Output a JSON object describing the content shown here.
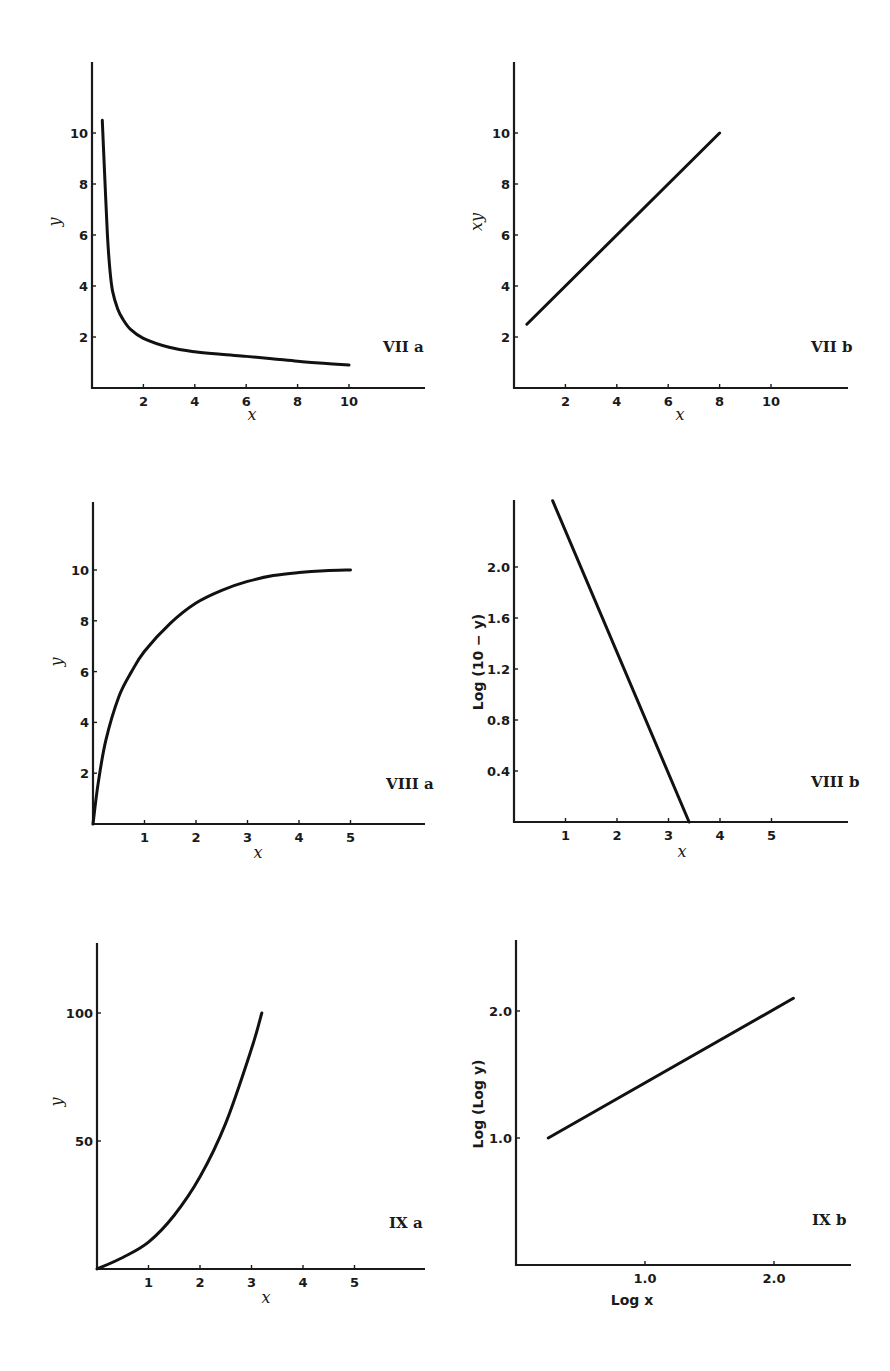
{
  "figure": {
    "panels": [
      {
        "id": "VIIa",
        "panel_label": "VII a",
        "xlabel": "x",
        "ylabel": "y",
        "origin_px": [
          92,
          388
        ],
        "x_end_px": 425,
        "y_top_px": 62,
        "x_scale": 25.7,
        "y_scale": 25.5,
        "x_offset": 0,
        "y_offset": 0,
        "xticks": [
          2,
          4,
          6,
          8,
          10
        ],
        "xtick_labels": [
          "2",
          "4",
          "6",
          "8",
          "10"
        ],
        "yticks": [
          2,
          4,
          6,
          8,
          10
        ],
        "ytick_labels": [
          "2",
          "4",
          "6",
          "8",
          "10"
        ],
        "label_pos": [
          383,
          352
        ]
      },
      {
        "id": "VIIb",
        "panel_label": "VII b",
        "xlabel": "x",
        "ylabel": "xy",
        "origin_px": [
          514,
          388
        ],
        "x_end_px": 848,
        "y_top_px": 62,
        "x_scale": 25.7,
        "y_scale": 25.5,
        "x_offset": 0,
        "y_offset": 0,
        "xticks": [
          2,
          4,
          6,
          8,
          10
        ],
        "xtick_labels": [
          "2",
          "4",
          "6",
          "8",
          "10"
        ],
        "yticks": [
          2,
          4,
          6,
          8,
          10
        ],
        "ytick_labels": [
          "2",
          "4",
          "6",
          "8",
          "10"
        ],
        "label_pos": [
          811,
          352
        ]
      },
      {
        "id": "VIIIa",
        "panel_label": "VIII a",
        "xlabel": "x",
        "ylabel": "y",
        "origin_px": [
          93,
          824
        ],
        "x_end_px": 425,
        "y_top_px": 502,
        "x_scale": 51.5,
        "y_scale": 25.4,
        "x_offset": 0,
        "y_offset": 0,
        "xticks": [
          1,
          2,
          3,
          4,
          5
        ],
        "xtick_labels": [
          "1",
          "2",
          "3",
          "4",
          "5"
        ],
        "yticks": [
          2,
          4,
          6,
          8,
          10
        ],
        "ytick_labels": [
          "2",
          "4",
          "6",
          "8",
          "10"
        ],
        "label_pos": [
          386,
          789
        ]
      },
      {
        "id": "VIIIb",
        "panel_label": "VIII b",
        "xlabel": "x",
        "ylabel": "Log (10 − y)",
        "origin_px": [
          514,
          822
        ],
        "x_end_px": 848,
        "y_top_px": 500,
        "x_scale": 51.5,
        "y_scale": 127.5,
        "x_offset": 0,
        "y_offset": 0,
        "xticks": [
          1,
          2,
          3,
          4,
          5
        ],
        "xtick_labels": [
          "1",
          "2",
          "3",
          "4",
          "5"
        ],
        "yticks": [
          0.4,
          0.8,
          1.2,
          1.6,
          2.0
        ],
        "ytick_labels": [
          "0.4",
          "0.8",
          "1.2",
          "1.6",
          "2.0"
        ],
        "label_pos": [
          811,
          787
        ]
      },
      {
        "id": "IXa",
        "panel_label": "IX a",
        "xlabel": "x",
        "ylabel": "y",
        "origin_px": [
          97,
          1269
        ],
        "x_end_px": 425,
        "y_top_px": 943,
        "x_scale": 51.5,
        "y_scale": 2.56,
        "x_offset": 0,
        "y_offset": 0,
        "xticks": [
          1,
          2,
          3,
          4,
          5
        ],
        "xtick_labels": [
          "1",
          "2",
          "3",
          "4",
          "5"
        ],
        "yticks": [
          50,
          100
        ],
        "ytick_labels": [
          "50",
          "100"
        ],
        "label_pos": [
          389,
          1228
        ]
      },
      {
        "id": "IXb",
        "panel_label": "IX b",
        "xlabel": "Log x",
        "ylabel": "Log (Log y)",
        "origin_px": [
          516,
          1265
        ],
        "x_end_px": 851,
        "y_top_px": 940,
        "x_scale": 129,
        "y_scale": 127,
        "x_offset": 0,
        "y_offset": 0,
        "xticks": [
          1.0,
          2.0
        ],
        "xtick_labels": [
          "1.0",
          "2.0"
        ],
        "yticks": [
          1.0,
          2.0
        ],
        "ytick_labels": [
          "1.0",
          "2.0"
        ],
        "label_pos": [
          812,
          1225
        ]
      }
    ]
  },
  "chart_data": [
    {
      "type": "line",
      "title": "VII a",
      "xlabel": "x",
      "ylabel": "y",
      "xlim": [
        0,
        12.5
      ],
      "ylim": [
        0,
        12.5
      ],
      "grid": false,
      "xticks": [
        2,
        4,
        6,
        8,
        10
      ],
      "yticks": [
        2,
        4,
        6,
        8,
        10
      ],
      "series": [
        {
          "name": "curve",
          "x": [
            0.4,
            0.5,
            0.6,
            0.7,
            0.8,
            1.0,
            1.2,
            1.5,
            2.0,
            3.0,
            4.0,
            5.0,
            6.0,
            7.0,
            8.0,
            9.0,
            10.0
          ],
          "y": [
            10.5,
            8.2,
            6.0,
            4.6,
            3.8,
            3.1,
            2.7,
            2.3,
            1.95,
            1.6,
            1.42,
            1.32,
            1.24,
            1.15,
            1.05,
            0.97,
            0.9
          ]
        }
      ]
    },
    {
      "type": "line",
      "title": "VII b",
      "xlabel": "x",
      "ylabel": "xy",
      "xlim": [
        0,
        13
      ],
      "ylim": [
        0,
        12.5
      ],
      "grid": false,
      "xticks": [
        2,
        4,
        6,
        8,
        10
      ],
      "yticks": [
        2,
        4,
        6,
        8,
        10
      ],
      "series": [
        {
          "name": "line",
          "x": [
            0.5,
            8.0
          ],
          "y": [
            2.5,
            10.0
          ]
        }
      ]
    },
    {
      "type": "line",
      "title": "VIII a",
      "xlabel": "x",
      "ylabel": "y",
      "xlim": [
        0,
        6.4
      ],
      "ylim": [
        0,
        12.5
      ],
      "grid": false,
      "xticks": [
        1,
        2,
        3,
        4,
        5
      ],
      "yticks": [
        2,
        4,
        6,
        8,
        10
      ],
      "series": [
        {
          "name": "curve",
          "x": [
            0,
            0.1,
            0.25,
            0.5,
            0.75,
            1.0,
            1.5,
            2.0,
            2.5,
            3.0,
            3.5,
            4.0,
            4.5,
            5.0
          ],
          "y": [
            0,
            1.6,
            3.3,
            5.0,
            6.0,
            6.8,
            7.9,
            8.7,
            9.2,
            9.55,
            9.78,
            9.9,
            9.97,
            10.0
          ]
        }
      ]
    },
    {
      "type": "line",
      "title": "VIII b",
      "xlabel": "x",
      "ylabel": "Log (10 − y)",
      "xlim": [
        0,
        6.5
      ],
      "ylim": [
        0,
        2.5
      ],
      "grid": false,
      "xticks": [
        1,
        2,
        3,
        4,
        5
      ],
      "yticks": [
        0.4,
        0.8,
        1.2,
        1.6,
        2.0
      ],
      "series": [
        {
          "name": "line",
          "x": [
            0.75,
            3.4
          ],
          "y": [
            2.52,
            0.0
          ]
        }
      ]
    },
    {
      "type": "line",
      "title": "IX a",
      "xlabel": "x",
      "ylabel": "y",
      "xlim": [
        0,
        6.4
      ],
      "ylim": [
        0,
        127
      ],
      "grid": false,
      "xticks": [
        1,
        2,
        3,
        4,
        5
      ],
      "yticks": [
        50,
        100
      ],
      "series": [
        {
          "name": "curve",
          "x": [
            0,
            0.5,
            1.0,
            1.5,
            2.0,
            2.5,
            3.0,
            3.2
          ],
          "y": [
            0,
            4.5,
            10.5,
            21,
            36,
            57,
            86,
            100
          ]
        }
      ]
    },
    {
      "type": "line",
      "title": "IX b",
      "xlabel": "Log x",
      "ylabel": "Log (Log y)",
      "xlim": [
        0,
        2.6
      ],
      "ylim": [
        0,
        2.55
      ],
      "grid": false,
      "xticks": [
        1.0,
        2.0
      ],
      "yticks": [
        1.0,
        2.0
      ],
      "series": [
        {
          "name": "line",
          "x": [
            0.25,
            2.15
          ],
          "y": [
            1.0,
            2.1
          ]
        }
      ]
    }
  ]
}
